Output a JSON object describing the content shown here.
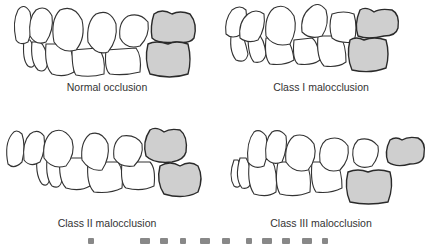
{
  "figure": {
    "panels": [
      {
        "id": "normal",
        "caption": "Normal occlusion"
      },
      {
        "id": "class1",
        "caption": "Class I malocclusion"
      },
      {
        "id": "class2",
        "caption": "Class II malocclusion"
      },
      {
        "id": "class3",
        "caption": "Class III malocclusion"
      }
    ],
    "colors": {
      "outline": "#333333",
      "molar_fill": "#cfcfcf",
      "tooth_fill": "#ffffff",
      "caption": "#333333"
    }
  }
}
